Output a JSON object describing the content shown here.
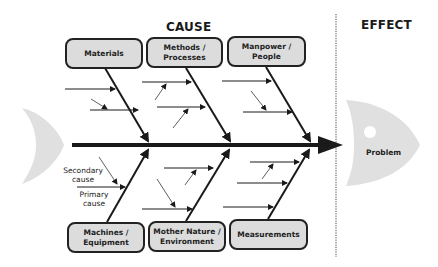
{
  "headings": {
    "cause": "CAUSE",
    "effect": "EFFECT"
  },
  "categories": {
    "top": [
      {
        "label": "Materials"
      },
      {
        "label": "Methods /\nProcesses"
      },
      {
        "label": "Manpower /\nPeople"
      }
    ],
    "bottom": [
      {
        "label": "Machines /\nEquipment"
      },
      {
        "label": "Mother Nature /\nEnvironment"
      },
      {
        "label": "Measurements"
      }
    ]
  },
  "annotations": {
    "secondary_cause": "Secondary\ncause",
    "primary_cause": "Primary\ncause"
  },
  "effect": {
    "label": "Problem"
  },
  "colors": {
    "line": "#1a1a1a",
    "box_fill": "#dcdcdc",
    "fish_fill": "#e0e0e0"
  }
}
